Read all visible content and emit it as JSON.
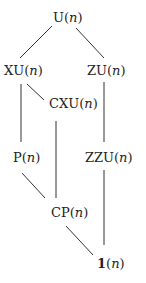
{
  "diagram": {
    "nodes": [
      {
        "id": "U",
        "prefix": "U",
        "arg": "n"
      },
      {
        "id": "XU",
        "prefix": "XU",
        "arg": "n"
      },
      {
        "id": "ZU",
        "prefix": "ZU",
        "arg": "n"
      },
      {
        "id": "CXU",
        "prefix": "CXU",
        "arg": "n"
      },
      {
        "id": "P",
        "prefix": "P",
        "arg": "n"
      },
      {
        "id": "ZZU",
        "prefix": "ZZU",
        "arg": "n"
      },
      {
        "id": "CP",
        "prefix": "CP",
        "arg": "n"
      },
      {
        "id": "ONE",
        "prefix": "1",
        "arg": "n"
      }
    ],
    "edges": [
      [
        "U",
        "XU"
      ],
      [
        "U",
        "ZU"
      ],
      [
        "XU",
        "CXU"
      ],
      [
        "XU",
        "P"
      ],
      [
        "CXU",
        "CP"
      ],
      [
        "ZU",
        "ZZU"
      ],
      [
        "P",
        "CP"
      ],
      [
        "ZZU",
        "ONE"
      ],
      [
        "CP",
        "ONE"
      ]
    ],
    "open_paren": "(",
    "close_paren": ")"
  }
}
